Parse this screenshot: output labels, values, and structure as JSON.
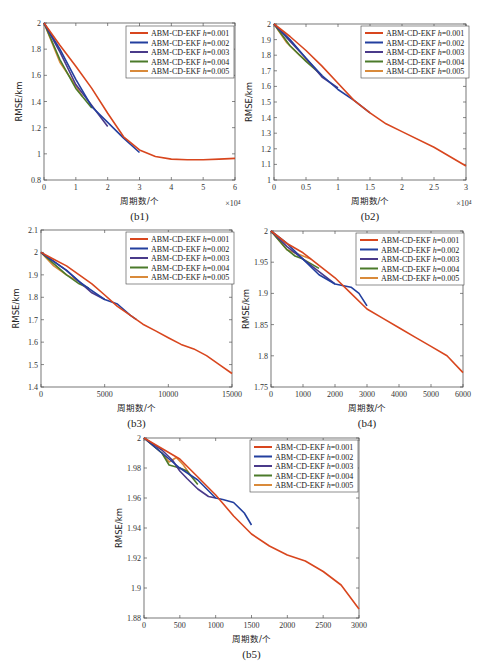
{
  "colors": {
    "h0.001": "#d8461e",
    "h0.002": "#233f9e",
    "h0.003": "#4a3a8a",
    "h0.004": "#4b7a2a",
    "h0.005": "#d98a3a"
  },
  "legend_labels": [
    "ABM-CD-EKF h=0.001",
    "ABM-CD-EKF h=0.002",
    "ABM-CD-EKF h=0.003",
    "ABM-CD-EKF h=0.004",
    "ABM-CD-EKF h=0.005"
  ],
  "chart_data": [
    {
      "id": "b1",
      "caption": "(b1)",
      "type": "line",
      "xlabel": "周期数/个",
      "ylabel": "RMSE/km",
      "x_multiplier": "×10⁴",
      "xlim": [
        0,
        6
      ],
      "ylim": [
        0.8,
        2
      ],
      "xticks": [
        "0",
        "1",
        "2",
        "3",
        "4",
        "5",
        "6"
      ],
      "xtick_vals": [
        0,
        1,
        2,
        3,
        4,
        5,
        6
      ],
      "yticks": [
        "0.8",
        "1",
        "1.2",
        "1.4",
        "1.6",
        "1.8",
        "2"
      ],
      "ytick_vals": [
        0.8,
        1,
        1.2,
        1.4,
        1.6,
        1.8,
        2
      ],
      "box": [
        44,
        23,
        235,
        180
      ],
      "legend": {
        "x": 126,
        "y": 26
      },
      "series": [
        {
          "name": "ABM-CD-EKF h=0.001",
          "key": "h0.001",
          "x": [
            0,
            0.5,
            1,
            1.5,
            2,
            2.5,
            3,
            3.5,
            4,
            4.5,
            5,
            5.5,
            6
          ],
          "y": [
            2,
            1.83,
            1.67,
            1.5,
            1.31,
            1.13,
            1.03,
            0.98,
            0.96,
            0.955,
            0.955,
            0.96,
            0.965
          ]
        },
        {
          "name": "ABM-CD-EKF h=0.002",
          "key": "h0.002",
          "x": [
            0,
            0.5,
            1,
            1.5,
            2,
            2.5,
            3
          ],
          "y": [
            2,
            1.8,
            1.57,
            1.36,
            1.24,
            1.12,
            1.01
          ]
        },
        {
          "name": "ABM-CD-EKF h=0.003",
          "key": "h0.003",
          "x": [
            0,
            0.5,
            1,
            1.5,
            2
          ],
          "y": [
            2,
            1.78,
            1.53,
            1.37,
            1.21
          ]
        },
        {
          "name": "ABM-CD-EKF h=0.004",
          "key": "h0.004",
          "x": [
            0,
            0.5,
            1,
            1.5
          ],
          "y": [
            2,
            1.72,
            1.5,
            1.35
          ]
        },
        {
          "name": "ABM-CD-EKF h=0.005",
          "key": "h0.005",
          "x": [
            0,
            0.5,
            1,
            1.2
          ],
          "y": [
            2,
            1.7,
            1.52,
            1.44
          ]
        }
      ]
    },
    {
      "id": "b2",
      "caption": "(b2)",
      "type": "line",
      "xlabel": "周期数/个",
      "ylabel": "RMSE/km",
      "x_multiplier": "×10⁴",
      "xlim": [
        0,
        3
      ],
      "ylim": [
        1,
        2
      ],
      "xticks": [
        "0",
        "0.5",
        "1",
        "1.5",
        "2",
        "2.5",
        "3"
      ],
      "xtick_vals": [
        0,
        0.5,
        1,
        1.5,
        2,
        2.5,
        3
      ],
      "yticks": [
        "1",
        "1.1",
        "1.2",
        "1.3",
        "1.4",
        "1.5",
        "1.6",
        "1.7",
        "1.8",
        "1.9",
        "2"
      ],
      "ytick_vals": [
        1,
        1.1,
        1.2,
        1.3,
        1.4,
        1.5,
        1.6,
        1.7,
        1.8,
        1.9,
        2
      ],
      "box": [
        274,
        24,
        466,
        180
      ],
      "legend": {
        "x": 361,
        "y": 26
      },
      "series": [
        {
          "name": "ABM-CD-EKF h=0.001",
          "key": "h0.001",
          "x": [
            0,
            0.25,
            0.5,
            0.75,
            1,
            1.25,
            1.5,
            1.75,
            2,
            2.5,
            3
          ],
          "y": [
            2,
            1.92,
            1.83,
            1.73,
            1.62,
            1.51,
            1.43,
            1.36,
            1.31,
            1.21,
            1.09
          ]
        },
        {
          "name": "ABM-CD-EKF h=0.002",
          "key": "h0.002",
          "x": [
            0,
            0.25,
            0.5,
            0.75,
            1,
            1.25,
            1.5
          ],
          "y": [
            2,
            1.9,
            1.78,
            1.67,
            1.58,
            1.51,
            1.43
          ]
        },
        {
          "name": "ABM-CD-EKF h=0.003",
          "key": "h0.003",
          "x": [
            0,
            0.25,
            0.5,
            0.75,
            1
          ],
          "y": [
            2,
            1.89,
            1.78,
            1.66,
            1.59
          ]
        },
        {
          "name": "ABM-CD-EKF h=0.004",
          "key": "h0.004",
          "x": [
            0,
            0.25,
            0.5,
            0.75
          ],
          "y": [
            2,
            1.86,
            1.76,
            1.67
          ]
        },
        {
          "name": "ABM-CD-EKF h=0.005",
          "key": "h0.005",
          "x": [
            0,
            0.2,
            0.4,
            0.6
          ],
          "y": [
            2,
            1.88,
            1.8,
            1.73
          ]
        }
      ]
    },
    {
      "id": "b3",
      "caption": "(b3)",
      "type": "line",
      "xlabel": "周期数/个",
      "ylabel": "RMSE/km",
      "xlim": [
        0,
        15000
      ],
      "ylim": [
        1.4,
        2.1
      ],
      "xticks": [
        "0",
        "5000",
        "10000",
        "15000"
      ],
      "xtick_vals": [
        0,
        5000,
        10000,
        15000
      ],
      "yticks": [
        "1.4",
        "1.5",
        "1.6",
        "1.7",
        "1.8",
        "1.9",
        "2",
        "2.1"
      ],
      "ytick_vals": [
        1.4,
        1.5,
        1.6,
        1.7,
        1.8,
        1.9,
        2,
        2.1
      ],
      "box": [
        41,
        230,
        232,
        387
      ],
      "legend": {
        "x": 126,
        "y": 232
      },
      "series": [
        {
          "name": "ABM-CD-EKF h=0.001",
          "key": "h0.001",
          "x": [
            0,
            1000,
            2000,
            3000,
            4000,
            5000,
            6000,
            7000,
            7500,
            8000,
            9000,
            10000,
            11000,
            12000,
            13000,
            14000,
            15000
          ],
          "y": [
            2,
            1.97,
            1.94,
            1.9,
            1.86,
            1.81,
            1.76,
            1.72,
            1.7,
            1.68,
            1.65,
            1.62,
            1.59,
            1.57,
            1.54,
            1.5,
            1.46
          ]
        },
        {
          "name": "ABM-CD-EKF h=0.002",
          "key": "h0.002",
          "x": [
            0,
            1000,
            2000,
            3000,
            4000,
            5000,
            6000,
            7000,
            7500
          ],
          "y": [
            2,
            1.96,
            1.92,
            1.87,
            1.83,
            1.79,
            1.77,
            1.72,
            1.7
          ]
        },
        {
          "name": "ABM-CD-EKF h=0.003",
          "key": "h0.003",
          "x": [
            0,
            1000,
            2000,
            3000,
            4000,
            5000
          ],
          "y": [
            2,
            1.96,
            1.92,
            1.87,
            1.82,
            1.79
          ]
        },
        {
          "name": "ABM-CD-EKF h=0.004",
          "key": "h0.004",
          "x": [
            0,
            1000,
            2000,
            3000,
            3750
          ],
          "y": [
            2,
            1.95,
            1.9,
            1.86,
            1.84
          ]
        },
        {
          "name": "ABM-CD-EKF h=0.005",
          "key": "h0.005",
          "x": [
            0,
            1000,
            2000,
            3000
          ],
          "y": [
            2,
            1.94,
            1.9,
            1.87
          ]
        }
      ]
    },
    {
      "id": "b4",
      "caption": "(b4)",
      "type": "line",
      "xlabel": "周期数/个",
      "ylabel": "RMSE/km",
      "xlim": [
        0,
        6000
      ],
      "ylim": [
        1.75,
        2
      ],
      "xticks": [
        "0",
        "1000",
        "2000",
        "3000",
        "4000",
        "5000",
        "6000"
      ],
      "xtick_vals": [
        0,
        1000,
        2000,
        3000,
        4000,
        5000,
        6000
      ],
      "yticks": [
        "1.75",
        "1.8",
        "1.85",
        "1.9",
        "1.95",
        "2"
      ],
      "ytick_vals": [
        1.75,
        1.8,
        1.85,
        1.9,
        1.95,
        2
      ],
      "box": [
        271,
        231,
        463,
        387
      ],
      "legend": {
        "x": 356,
        "y": 233
      },
      "series": [
        {
          "name": "ABM-CD-EKF h=0.001",
          "key": "h0.001",
          "x": [
            0,
            500,
            1000,
            1500,
            2000,
            2500,
            3000,
            3500,
            4000,
            4500,
            5000,
            5500,
            6000
          ],
          "y": [
            2,
            1.98,
            1.965,
            1.945,
            1.925,
            1.9,
            1.875,
            1.86,
            1.845,
            1.83,
            1.815,
            1.8,
            1.773
          ]
        },
        {
          "name": "ABM-CD-EKF h=0.002",
          "key": "h0.002",
          "x": [
            0,
            500,
            1000,
            1500,
            2000,
            2500,
            2750,
            3000
          ],
          "y": [
            2,
            1.98,
            1.955,
            1.93,
            1.915,
            1.91,
            1.9,
            1.88
          ]
        },
        {
          "name": "ABM-CD-EKF h=0.003",
          "key": "h0.003",
          "x": [
            0,
            500,
            1000,
            1500,
            2000
          ],
          "y": [
            2,
            1.975,
            1.955,
            1.935,
            1.915
          ]
        },
        {
          "name": "ABM-CD-EKF h=0.004",
          "key": "h0.004",
          "x": [
            0,
            500,
            750,
            1000,
            1500
          ],
          "y": [
            2,
            1.97,
            1.96,
            1.955,
            1.94
          ]
        },
        {
          "name": "ABM-CD-EKF h=0.005",
          "key": "h0.005",
          "x": [
            0,
            500,
            1000,
            1250
          ],
          "y": [
            2,
            1.97,
            1.96,
            1.955
          ]
        }
      ]
    },
    {
      "id": "b5",
      "caption": "(b5)",
      "type": "line",
      "xlabel": "周期数/个",
      "ylabel": "RMSE/km",
      "xlim": [
        0,
        3000
      ],
      "ylim": [
        1.88,
        2
      ],
      "xticks": [
        "0",
        "500",
        "1000",
        "1500",
        "2000",
        "2500",
        "3000"
      ],
      "xtick_vals": [
        0,
        500,
        1000,
        1500,
        2000,
        2500,
        3000
      ],
      "yticks": [
        "1.88",
        "1.9",
        "1.92",
        "1.94",
        "1.96",
        "1.98",
        "2"
      ],
      "ytick_vals": [
        1.88,
        1.9,
        1.92,
        1.94,
        1.96,
        1.98,
        2
      ],
      "box": [
        144,
        438,
        359,
        618
      ],
      "legend": {
        "x": 250,
        "y": 440
      },
      "series": [
        {
          "name": "ABM-CD-EKF h=0.001",
          "key": "h0.001",
          "x": [
            0,
            250,
            500,
            750,
            1000,
            1250,
            1500,
            1750,
            2000,
            2250,
            2500,
            2750,
            3000
          ],
          "y": [
            2,
            1.993,
            1.986,
            1.974,
            1.962,
            1.948,
            1.936,
            1.928,
            1.922,
            1.918,
            1.911,
            1.902,
            1.886
          ]
        },
        {
          "name": "ABM-CD-EKF h=0.002",
          "key": "h0.002",
          "x": [
            0,
            250,
            500,
            750,
            1000,
            1100,
            1250,
            1400,
            1500
          ],
          "y": [
            2,
            1.99,
            1.98,
            1.972,
            1.96,
            1.959,
            1.957,
            1.95,
            1.942
          ]
        },
        {
          "name": "ABM-CD-EKF h=0.003",
          "key": "h0.003",
          "x": [
            0,
            250,
            400,
            500,
            600,
            750,
            900,
            1000
          ],
          "y": [
            2,
            1.992,
            1.985,
            1.978,
            1.973,
            1.966,
            1.961,
            1.96
          ]
        },
        {
          "name": "ABM-CD-EKF h=0.004",
          "key": "h0.004",
          "x": [
            0,
            250,
            350,
            500,
            600,
            750
          ],
          "y": [
            2,
            1.99,
            1.982,
            1.98,
            1.978,
            1.969
          ]
        },
        {
          "name": "ABM-CD-EKF h=0.005",
          "key": "h0.005",
          "x": [
            0,
            250,
            350,
            450,
            550,
            650
          ],
          "y": [
            2,
            1.99,
            1.984,
            1.987,
            1.982,
            1.975
          ]
        }
      ]
    }
  ]
}
